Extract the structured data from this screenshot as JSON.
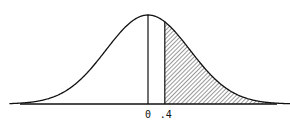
{
  "chart_data": {
    "type": "area",
    "title": "",
    "xlabel": "",
    "ylabel": "",
    "distribution": {
      "name": "standard normal",
      "mean": 0,
      "sd": 1
    },
    "xlim": [
      -3.3,
      3.4
    ],
    "grid": false,
    "legend": null,
    "tick_labels": [
      "0",
      ".4"
    ],
    "tick_values": [
      0,
      0.4
    ],
    "vertical_lines": [
      0,
      0.4
    ],
    "shaded_region": {
      "from": 0.4,
      "to": "inf",
      "pattern": "diagonal-hatch"
    },
    "colors": {
      "line": "#111111",
      "hatch": "#333333",
      "background": "#ffffff"
    }
  },
  "labels": {
    "zero": "0",
    "point_four": ".4"
  },
  "layout": {
    "baseline_y": 104,
    "axis_x_start": 20,
    "axis_x_end": 277,
    "center_x": 148,
    "sigma_px": 42,
    "peak_height_px": 89
  }
}
